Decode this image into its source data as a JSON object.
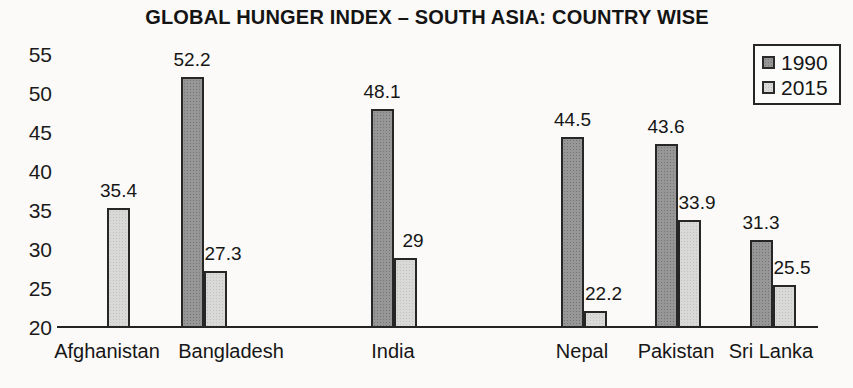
{
  "chart_data": {
    "type": "bar",
    "title": "GLOBAL HUNGER INDEX – SOUTH ASIA: COUNTRY WISE",
    "xlabel": "",
    "ylabel": "",
    "categories": [
      "Afghanistan",
      "Bangladesh",
      "India",
      "Nepal",
      "Pakistan",
      "Sri Lanka"
    ],
    "series": [
      {
        "name": "1990",
        "color": "#979797",
        "values": [
          null,
          52.2,
          48.1,
          44.5,
          43.6,
          31.3
        ]
      },
      {
        "name": "2015",
        "color": "#d9d9d7",
        "values": [
          35.4,
          27.3,
          29,
          22.2,
          33.9,
          25.5
        ]
      }
    ],
    "value_labels": [
      [
        null,
        "52.2",
        "48.1",
        "44.5",
        "43.6",
        "31.3"
      ],
      [
        "35.4",
        "27.3",
        "29",
        "22.2",
        "33.9",
        "25.5"
      ]
    ],
    "ylim": [
      20,
      55
    ],
    "yticks": [
      55,
      50,
      45,
      40,
      35,
      30,
      25,
      20
    ],
    "grid": false,
    "legend_position": "top-right",
    "pixel_layout": {
      "baseline_y_px": 328,
      "px_per_unit": 7.8,
      "bar_width_px": 23,
      "axis_x_start_px": 57,
      "axis_x_end_px": 818,
      "category_centers_px": [
        107,
        203.5,
        393.5,
        584,
        677.5,
        772.5
      ],
      "category_label_centers_px": [
        107,
        231,
        393,
        582,
        676,
        771
      ]
    }
  },
  "legend": {
    "items": [
      {
        "label": "1990",
        "color": "#979797"
      },
      {
        "label": "2015",
        "color": "#d9d9d7"
      }
    ]
  }
}
